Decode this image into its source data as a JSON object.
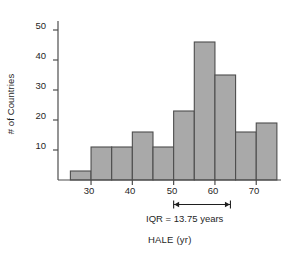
{
  "chart_data": {
    "type": "bar",
    "title": "",
    "subtitle": "",
    "xlabel": "HALE (yr)",
    "ylabel": "# of Countries",
    "categories": [
      "25-30",
      "30-35",
      "35-40",
      "40-45",
      "45-50",
      "50-55",
      "55-60",
      "60-65",
      "65-70",
      "70-75"
    ],
    "bin_edges": [
      25,
      30,
      35,
      40,
      45,
      50,
      55,
      60,
      65,
      70,
      75
    ],
    "bin_width": 5,
    "values": [
      3,
      11,
      11,
      16,
      11,
      23,
      46,
      35,
      16,
      19
    ],
    "xlim": [
      22,
      76
    ],
    "ylim": [
      0,
      53
    ],
    "xticks": [
      30,
      40,
      50,
      60,
      70
    ],
    "yticks": [
      10,
      20,
      30,
      40,
      50
    ],
    "xtick_labels": [
      "30",
      "40",
      "50",
      "60",
      "70"
    ],
    "ytick_labels": [
      "10",
      "20",
      "30",
      "40",
      "50"
    ],
    "grid": false,
    "legend": null,
    "bar_color": "#a9a9a9",
    "bar_edge_color": "#4d4d4d",
    "axis_color": "#4d4d4d",
    "annotations": [
      {
        "name": "iqr-annotation",
        "text": "IQR = 13.75 years",
        "type": "double-arrow",
        "x_start": 50,
        "x_end": 63.75,
        "value": 13.75,
        "units": "years"
      }
    ]
  },
  "axes": {
    "y_title": "# of Countries",
    "x_title": "HALE (yr)",
    "y_ticks": [
      {
        "label": "50"
      },
      {
        "label": "40"
      },
      {
        "label": "30"
      },
      {
        "label": "20"
      },
      {
        "label": "10"
      }
    ],
    "x_ticks": [
      {
        "label": "30"
      },
      {
        "label": "40"
      },
      {
        "label": "50"
      },
      {
        "label": "60"
      },
      {
        "label": "70"
      }
    ]
  },
  "annotation": {
    "iqr_label": "IQR = 13.75 years"
  }
}
